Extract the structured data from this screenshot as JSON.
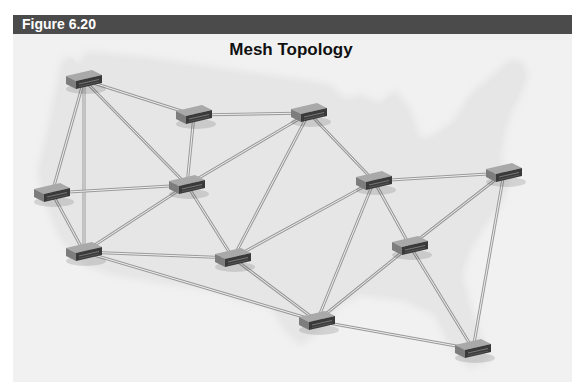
{
  "figure": {
    "label": "Figure 6.20",
    "title": "Mesh Topology"
  },
  "colors": {
    "header_bg": "#4b4b4b",
    "frame_bg": "#f1f1f1",
    "map_fill": "#e2e2e2",
    "link": "#9a9a9a",
    "node_top": "#a9a9a9",
    "node_front": "#3a3a3a"
  },
  "nodes": [
    {
      "id": "n1",
      "x": 84,
      "y": 80
    },
    {
      "id": "n2",
      "x": 194,
      "y": 115
    },
    {
      "id": "n3",
      "x": 309,
      "y": 113
    },
    {
      "id": "n4",
      "x": 52,
      "y": 193
    },
    {
      "id": "n5",
      "x": 187,
      "y": 185
    },
    {
      "id": "n6",
      "x": 374,
      "y": 181
    },
    {
      "id": "n7",
      "x": 504,
      "y": 173
    },
    {
      "id": "n8",
      "x": 84,
      "y": 252
    },
    {
      "id": "n9",
      "x": 233,
      "y": 258
    },
    {
      "id": "n10",
      "x": 410,
      "y": 246
    },
    {
      "id": "n11",
      "x": 317,
      "y": 321
    },
    {
      "id": "n12",
      "x": 473,
      "y": 349
    }
  ],
  "links": [
    [
      "n1",
      "n2"
    ],
    [
      "n1",
      "n4"
    ],
    [
      "n1",
      "n8"
    ],
    [
      "n1",
      "n5"
    ],
    [
      "n2",
      "n3"
    ],
    [
      "n2",
      "n5"
    ],
    [
      "n3",
      "n5"
    ],
    [
      "n3",
      "n9"
    ],
    [
      "n3",
      "n6"
    ],
    [
      "n4",
      "n5"
    ],
    [
      "n4",
      "n8"
    ],
    [
      "n5",
      "n8"
    ],
    [
      "n5",
      "n9"
    ],
    [
      "n6",
      "n7"
    ],
    [
      "n6",
      "n9"
    ],
    [
      "n6",
      "n11"
    ],
    [
      "n6",
      "n10"
    ],
    [
      "n7",
      "n10"
    ],
    [
      "n7",
      "n12"
    ],
    [
      "n8",
      "n9"
    ],
    [
      "n8",
      "n11"
    ],
    [
      "n9",
      "n11"
    ],
    [
      "n10",
      "n11"
    ],
    [
      "n10",
      "n12"
    ],
    [
      "n11",
      "n12"
    ]
  ]
}
